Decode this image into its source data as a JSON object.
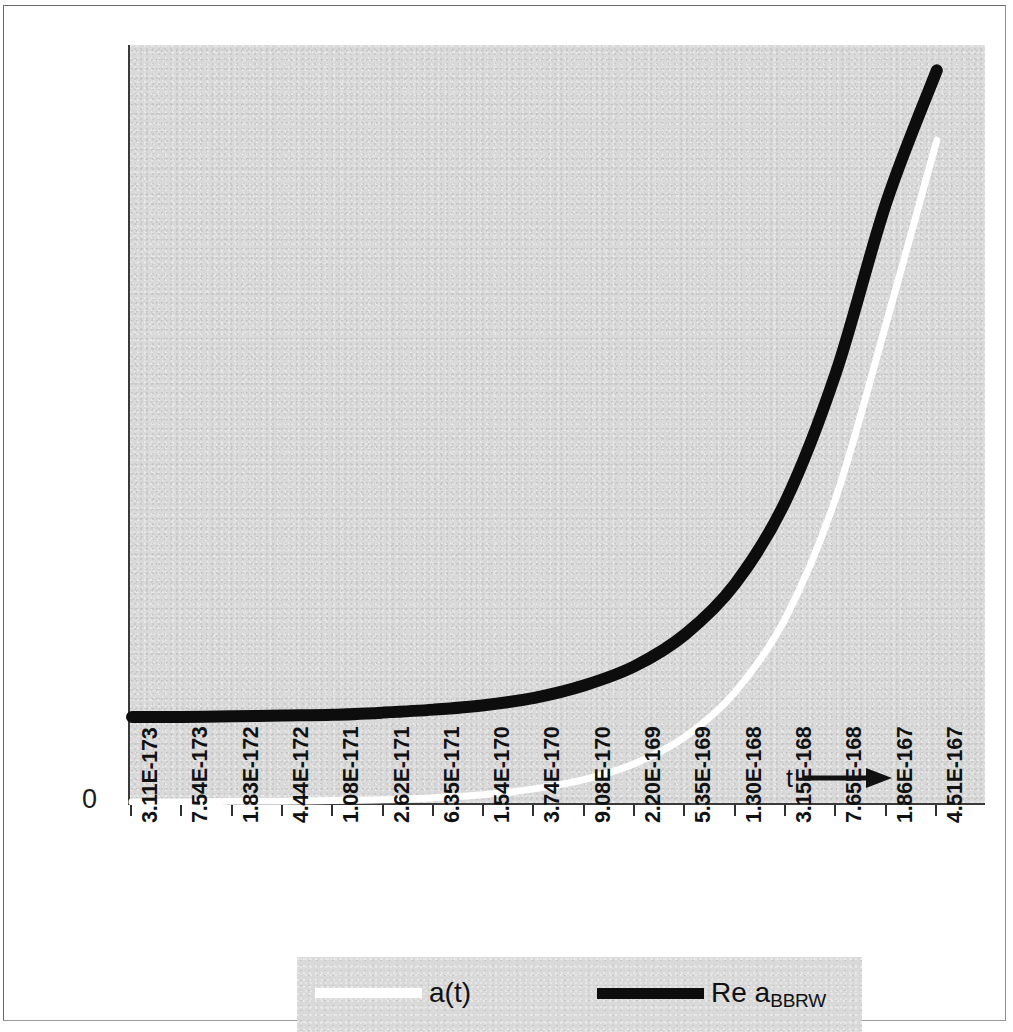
{
  "chart_data": {
    "type": "line",
    "title": "",
    "xlabel": "t",
    "ylabel": "",
    "grid": false,
    "legend_position": "bottom",
    "y_axis_ticks": [
      "0"
    ],
    "ylim": [
      0,
      1
    ],
    "x_tick_labels": [
      "3.11E-173",
      "7.54E-173",
      "1.83E-172",
      "4.44E-172",
      "1.08E-171",
      "2.62E-171",
      "6.35E-171",
      "1.54E-170",
      "3.74E-170",
      "9.08E-170",
      "2.20E-169",
      "5.35E-169",
      "1.30E-168",
      "3.15E-168",
      "7.65E-168",
      "1.86E-167",
      "4.51E-167"
    ],
    "x": [
      3.11e-173,
      7.54e-173,
      1.83e-172,
      4.44e-172,
      1.08e-171,
      2.62e-171,
      6.35e-171,
      1.54e-170,
      3.74e-170,
      9.08e-170,
      2.2e-169,
      5.35e-169,
      1.3e-168,
      3.15e-168,
      7.65e-168,
      1.86e-167,
      4.51e-167
    ],
    "series": [
      {
        "name": "a(t)",
        "color": "#ffffff",
        "values": [
          0.0,
          0.0,
          0.001,
          0.001,
          0.002,
          0.003,
          0.006,
          0.01,
          0.018,
          0.031,
          0.053,
          0.09,
          0.152,
          0.254,
          0.42,
          0.66,
          0.91
        ]
      },
      {
        "name": "Re a_BBRW",
        "name_base": "Re a",
        "name_sub": "BBRW",
        "color": "#0d0d0d",
        "values": [
          0.115,
          0.115,
          0.116,
          0.117,
          0.118,
          0.121,
          0.125,
          0.131,
          0.141,
          0.158,
          0.184,
          0.227,
          0.296,
          0.408,
          0.582,
          0.812,
          0.99
        ]
      }
    ],
    "annotations": [
      {
        "text": "t",
        "icon": "right-arrow",
        "position": "inside-bottom-right"
      }
    ]
  },
  "axis": {
    "zero_label": "0"
  },
  "annotation": {
    "t_label": "t"
  },
  "legend": {
    "entries": [
      {
        "label": "a(t)",
        "swatch": "white"
      },
      {
        "label_base": "Re a",
        "label_sub": "BBRW",
        "swatch": "black"
      }
    ]
  }
}
